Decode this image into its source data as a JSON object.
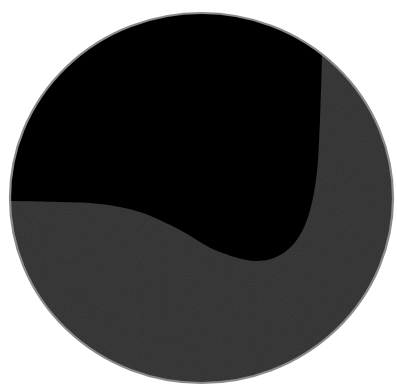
{
  "canvas": {
    "width": 397,
    "height": 391,
    "background": "#ffffff"
  },
  "subject": {
    "description": "dark circular glass disc / lens",
    "ellipse": {
      "cx": 201.5,
      "cy": 198,
      "rx": 191.5,
      "ry": 185
    },
    "rim": {
      "color": "#8a8a8a",
      "width": 2.2
    },
    "regions": [
      {
        "name": "black-region",
        "color": "#000000",
        "description": "upper-left glossy black area"
      },
      {
        "name": "grey-region",
        "color": "#303030",
        "description": "lower and right dark-grey textured area",
        "boundary_points": [
          [
            10,
            201
          ],
          [
            60,
            202
          ],
          [
            100,
            204
          ],
          [
            140,
            212
          ],
          [
            180,
            230
          ],
          [
            215,
            250
          ],
          [
            255,
            261
          ],
          [
            285,
            252
          ],
          [
            305,
            225
          ],
          [
            316,
            180
          ],
          [
            320,
            120
          ],
          [
            322,
            55
          ]
        ]
      }
    ]
  }
}
